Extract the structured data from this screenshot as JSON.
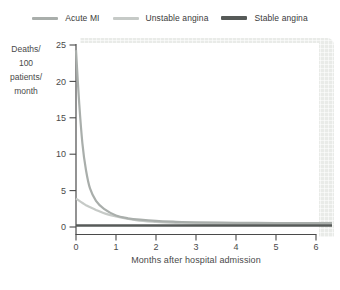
{
  "figure": {
    "xlabel": "Months after hospital admission",
    "ylabel_lines": [
      "Deaths/",
      "100",
      "patients/",
      "month"
    ]
  },
  "chart_data": {
    "type": "line",
    "title": "",
    "xlabel": "Months after hospital admission",
    "ylabel": "Deaths/100 patients/month",
    "xlim": [
      0,
      6
    ],
    "ylim": [
      0,
      25
    ],
    "xticks": [
      0,
      1,
      2,
      3,
      4,
      5,
      6
    ],
    "yticks": [
      25,
      20,
      15,
      10,
      5,
      0
    ],
    "grid": false,
    "legend_position": "top",
    "axis_color": "#4a4a4a",
    "tick_label_color": "#4a4a4a",
    "accent_panel_color": "#e9ebe8",
    "series": [
      {
        "name": "Acute MI",
        "color": "#a9aeab",
        "line_width": 2.2,
        "legend_thickness": 3,
        "points": [
          [
            0,
            24.3
          ],
          [
            0.08,
            17.0
          ],
          [
            0.16,
            11.5
          ],
          [
            0.25,
            7.8
          ],
          [
            0.35,
            5.3
          ],
          [
            0.5,
            3.6
          ],
          [
            0.7,
            2.5
          ],
          [
            1,
            1.6
          ],
          [
            1.3,
            1.2
          ],
          [
            1.6,
            1.0
          ],
          [
            2,
            0.85
          ],
          [
            2.5,
            0.72
          ],
          [
            3,
            0.65
          ],
          [
            4,
            0.58
          ],
          [
            5,
            0.55
          ],
          [
            6,
            0.55
          ],
          [
            6.4,
            0.55
          ]
        ]
      },
      {
        "name": "Unstable angina",
        "color": "#c6cac7",
        "line_width": 2.2,
        "legend_thickness": 3,
        "points": [
          [
            0,
            3.9
          ],
          [
            0.25,
            3.0
          ],
          [
            0.5,
            2.35
          ],
          [
            0.75,
            1.8
          ],
          [
            1,
            1.45
          ],
          [
            1.5,
            0.95
          ],
          [
            2,
            0.7
          ],
          [
            2.5,
            0.55
          ],
          [
            3,
            0.45
          ],
          [
            4,
            0.38
          ],
          [
            5,
            0.33
          ],
          [
            6,
            0.3
          ],
          [
            6.4,
            0.3
          ]
        ]
      },
      {
        "name": "Stable angina",
        "color": "#565a58",
        "line_width": 2.6,
        "legend_thickness": 4,
        "points": [
          [
            0,
            0.2
          ],
          [
            6.4,
            0.2
          ]
        ]
      }
    ]
  }
}
